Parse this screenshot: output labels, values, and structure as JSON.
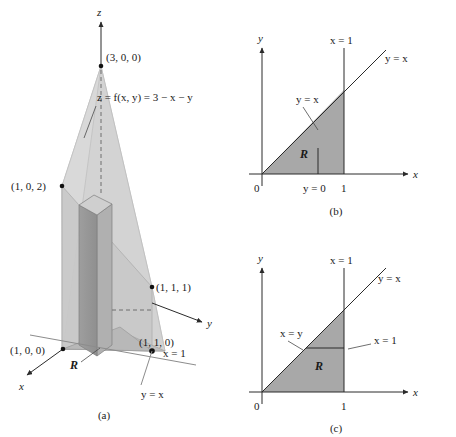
{
  "figure": {
    "colors": {
      "shade_region": "#a8a8a8",
      "plane_light": "#d9d9d9",
      "plane_mid": "#c6c6c6",
      "prism_dark": "#9a9a9a",
      "prism_mid": "#b4b4b4",
      "axis": "#2a2a2a",
      "gray_line": "#8c8c8c",
      "dashed": "#6e6e6e"
    }
  },
  "panel_a": {
    "caption": "(a)",
    "axes": {
      "z": "z",
      "x": "x",
      "y": "y"
    },
    "labels": {
      "apex_point": "(3, 0, 0)",
      "surface_equation": "z = f(x, y) = 3 − x − y",
      "point_102": "(1, 0, 2)",
      "point_111": "(1, 1, 1)",
      "point_100": "(1, 0, 0)",
      "point_110": "(1, 1, 0)",
      "region": "R",
      "plane_x1": "x = 1",
      "line_yx": "y = x"
    }
  },
  "panel_b": {
    "caption": "(b)",
    "axes": {
      "y": "y",
      "x": "x"
    },
    "labels": {
      "vertical_line": "x = 1",
      "diagonal_outer": "y = x",
      "diagonal_inner": "y = x",
      "region": "R",
      "origin": "0",
      "tick_inner": "y = 0",
      "tick_one": "1"
    }
  },
  "panel_c": {
    "caption": "(c)",
    "axes": {
      "y": "y",
      "x": "x"
    },
    "labels": {
      "vertical_line": "x = 1",
      "diagonal_outer": "y = x",
      "diagonal_inner": "x = y",
      "horizontal_inner": "x = 1",
      "region": "R",
      "origin": "0",
      "tick_one": "1"
    }
  }
}
